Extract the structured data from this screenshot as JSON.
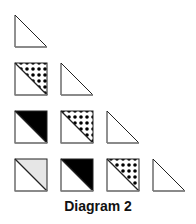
{
  "caption": "Diagram 2",
  "colors": {
    "stroke": "#222222",
    "edge_bottom": "#888888",
    "black_fill": "#000000",
    "gray_fill": "#e6e6e6",
    "dot_color": "#000000",
    "background": "#ffffff"
  },
  "layout": {
    "cell_size": 32,
    "col_x": [
      15,
      61,
      107,
      153
    ],
    "row_y": [
      15,
      63,
      111,
      159
    ]
  },
  "rows": [
    {
      "row": 1,
      "cells": [
        "triangle"
      ]
    },
    {
      "row": 2,
      "cells": [
        "dotted-square",
        "triangle"
      ]
    },
    {
      "row": 3,
      "cells": [
        "black-square",
        "dotted-square",
        "triangle"
      ]
    },
    {
      "row": 4,
      "cells": [
        "gray-square",
        "black-square",
        "dotted-square",
        "triangle"
      ]
    }
  ],
  "legend": {
    "triangle": "Outline right triangle (white)",
    "dotted-square": "Square split by diagonal, upper-right half dotted",
    "black-square": "Square split by diagonal, upper-right half solid black",
    "gray-square": "Square split by diagonal, upper-right half light gray"
  }
}
